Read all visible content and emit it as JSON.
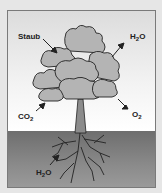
{
  "diagram": {
    "labels": {
      "dust": "Staub",
      "water_out": {
        "base": "H",
        "sub": "2",
        "tail": "O"
      },
      "co2": {
        "base": "CO",
        "sub": "2"
      },
      "o2": {
        "base": "O",
        "sub": "2"
      },
      "water_in": {
        "base": "H",
        "sub": "2",
        "tail": "O"
      }
    },
    "colors": {
      "background": "#e6e6e6",
      "sky_top": "#dcdcdc",
      "sky_bottom": "#ffffff",
      "ground": "#7a7a7a",
      "canopy": "#b4b4b4",
      "outline": "#222222",
      "trunk": "#8c8c8c"
    }
  }
}
